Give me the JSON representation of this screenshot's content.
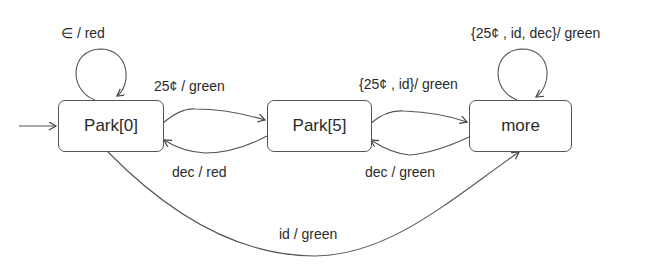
{
  "diagram": {
    "type": "state-machine",
    "states": [
      {
        "id": "park0",
        "label": "Park[0]",
        "initial": true
      },
      {
        "id": "park5",
        "label": "Park[5]"
      },
      {
        "id": "more",
        "label": "more"
      }
    ],
    "transitions": [
      {
        "from": "park0",
        "to": "park0",
        "label": "∈ / red"
      },
      {
        "from": "park0",
        "to": "park5",
        "label": "25¢ / green"
      },
      {
        "from": "park5",
        "to": "park0",
        "label": "dec / red"
      },
      {
        "from": "park5",
        "to": "more",
        "label": "{25¢ , id}/ green"
      },
      {
        "from": "more",
        "to": "park5",
        "label": "dec / green"
      },
      {
        "from": "more",
        "to": "more",
        "label": "{25¢ , id, dec}/ green"
      },
      {
        "from": "park0",
        "to": "more",
        "label": "id / green"
      }
    ]
  }
}
